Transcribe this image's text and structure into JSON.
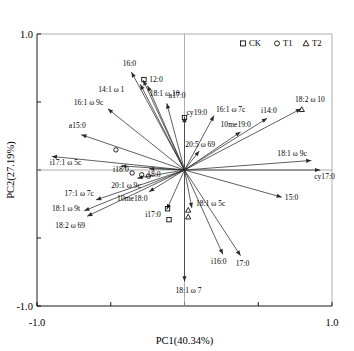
{
  "chart_data": {
    "type": "scatter",
    "title": "",
    "xlabel": "PC1(40.34%)",
    "ylabel": "PC2(27.19%)",
    "xlim": [
      -1.0,
      1.0
    ],
    "ylim": [
      -1.0,
      1.0
    ],
    "xticks": [
      "-1.0",
      "",
      "",
      "1.0"
    ],
    "yticks": [
      "1.0",
      "",
      "",
      "-1.0"
    ],
    "xtick_labels": [
      "-1.0",
      "1.0"
    ],
    "ytick_labels": [
      "1.0",
      "-1.0"
    ],
    "grid": false,
    "reference_lines": {
      "vertical_at_x": 0.0,
      "horizontal_at_y": 0.0
    },
    "legend": {
      "position": "top-right",
      "entries": [
        {
          "label": "CK",
          "marker": "square"
        },
        {
          "label": "T1",
          "marker": "circle"
        },
        {
          "label": "T2",
          "marker": "triangle"
        }
      ]
    },
    "vectors": [
      {
        "label": "16:0",
        "x": -0.36,
        "y": 0.72,
        "label_dx": -2,
        "label_dy": -6,
        "anchor": "middle"
      },
      {
        "label": "12:0",
        "x": -0.28,
        "y": 0.66,
        "label_dx": 6,
        "label_dy": 2,
        "anchor": "start"
      },
      {
        "label": "14:1 ω 1",
        "x": -0.3,
        "y": 0.63,
        "label_dx": -42,
        "label_dy": 8,
        "anchor": "start"
      },
      {
        "label": "18:1 ω 10",
        "x": -0.25,
        "y": 0.62,
        "label_dx": 2,
        "label_dy": 10,
        "anchor": "start"
      },
      {
        "label": "16:1 ω 9c",
        "x": -0.52,
        "y": 0.45,
        "label_dx": -34,
        "label_dy": -4,
        "anchor": "start"
      },
      {
        "label": "a17:0",
        "x": -0.12,
        "y": 0.49,
        "label_dx": 2,
        "label_dy": -5,
        "anchor": "start"
      },
      {
        "label": "a15:0",
        "x": -0.7,
        "y": 0.26,
        "label_dx": -4,
        "label_dy": -7,
        "anchor": "middle"
      },
      {
        "label": "i17:1 ω 5c",
        "x": -0.9,
        "y": 0.1,
        "label_dx": -2,
        "label_dy": 9,
        "anchor": "start"
      },
      {
        "label": "i18:0",
        "x": -0.43,
        "y": 0.03,
        "label_dx": -8,
        "label_dy": 6,
        "anchor": "start"
      },
      {
        "label": "18:0",
        "x": -0.24,
        "y": 0.01,
        "label_dx": -2,
        "label_dy": 8,
        "anchor": "start"
      },
      {
        "label": "20:1 ω 9c",
        "x": -0.32,
        "y": -0.06,
        "label_dx": -26,
        "label_dy": 10,
        "anchor": "start"
      },
      {
        "label": "cy19:0",
        "x": 0.0,
        "y": 0.39,
        "label_dx": 2,
        "label_dy": -2,
        "anchor": "start"
      },
      {
        "label": "16:1 ω 7c",
        "x": 0.2,
        "y": 0.4,
        "label_dx": 2,
        "label_dy": -4,
        "anchor": "start"
      },
      {
        "label": "20:5 ω 69",
        "x": 0.1,
        "y": 0.14,
        "label_dx": -14,
        "label_dy": -4,
        "anchor": "start"
      },
      {
        "label": "10me19:0",
        "x": 0.38,
        "y": 0.28,
        "label_dx": -20,
        "label_dy": -5,
        "anchor": "start"
      },
      {
        "label": "i14:0",
        "x": 0.56,
        "y": 0.38,
        "label_dx": -6,
        "label_dy": -5,
        "anchor": "start"
      },
      {
        "label": "18:2 ω 10",
        "x": 0.79,
        "y": 0.45,
        "label_dx": -6,
        "label_dy": -7,
        "anchor": "start"
      },
      {
        "label": "18:1 ω 9c",
        "x": 0.86,
        "y": 0.07,
        "label_dx": -34,
        "label_dy": -4,
        "anchor": "start"
      },
      {
        "label": "cy17:0",
        "x": 0.92,
        "y": 0.0,
        "label_dx": -6,
        "label_dy": 9,
        "anchor": "start"
      },
      {
        "label": "15:0",
        "x": 0.66,
        "y": -0.2,
        "label_dx": 3,
        "label_dy": 3,
        "anchor": "start"
      },
      {
        "label": "10me18:0",
        "x": -0.24,
        "y": -0.16,
        "label_dx": -32,
        "label_dy": 9,
        "anchor": "start"
      },
      {
        "label": "17:1 ω 7c",
        "x": -0.6,
        "y": -0.22,
        "label_dx": -2,
        "label_dy": -4,
        "anchor": "end"
      },
      {
        "label": "18:1 ω 9t",
        "x": -0.68,
        "y": -0.3,
        "label_dx": -4,
        "label_dy": 0,
        "anchor": "end"
      },
      {
        "label": "18:2 ω 69",
        "x": -0.66,
        "y": -0.34,
        "label_dx": -2,
        "label_dy": 12,
        "anchor": "end"
      },
      {
        "label": "i17:0",
        "x": -0.12,
        "y": -0.29,
        "label_dx": -6,
        "label_dy": 8,
        "anchor": "end"
      },
      {
        "label": "18:1 ω 5c",
        "x": 0.05,
        "y": -0.28,
        "label_dx": 4,
        "label_dy": -2,
        "anchor": "start"
      },
      {
        "label": "i16:0",
        "x": 0.26,
        "y": -0.62,
        "label_dx": -4,
        "label_dy": 10,
        "anchor": "middle"
      },
      {
        "label": "17:0",
        "x": 0.38,
        "y": -0.63,
        "label_dx": 2,
        "label_dy": 10,
        "anchor": "middle"
      },
      {
        "label": "18:1 ω 7",
        "x": 0.0,
        "y": -0.82,
        "label_dx": 4,
        "label_dy": 11,
        "anchor": "middle"
      }
    ],
    "sample_points": [
      {
        "group": "CK",
        "marker": "square",
        "x": -0.275,
        "y": 0.665
      },
      {
        "group": "CK",
        "marker": "square",
        "x": 0.0,
        "y": 0.385
      },
      {
        "group": "T1",
        "marker": "circle",
        "x": -0.465,
        "y": 0.148
      },
      {
        "group": "T1",
        "marker": "circle",
        "x": -0.355,
        "y": -0.022
      },
      {
        "group": "T1",
        "marker": "circle",
        "x": -0.29,
        "y": -0.035
      },
      {
        "group": "T1",
        "marker": "circle",
        "x": -0.245,
        "y": -0.045
      },
      {
        "group": "T2",
        "marker": "triangle",
        "x": 0.795,
        "y": 0.445
      },
      {
        "group": "CK",
        "marker": "square",
        "x": -0.115,
        "y": -0.285
      },
      {
        "group": "CK",
        "marker": "square",
        "x": -0.105,
        "y": -0.365
      },
      {
        "group": "T2",
        "marker": "triangle",
        "x": 0.025,
        "y": -0.295
      },
      {
        "group": "T2",
        "marker": "triangle",
        "x": 0.025,
        "y": -0.345
      }
    ]
  }
}
